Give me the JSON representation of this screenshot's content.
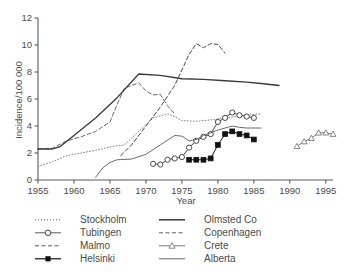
{
  "chart_data": {
    "type": "line",
    "title": "",
    "xlabel": "Year",
    "ylabel": "Incidence/100 000",
    "xlim": [
      1955,
      1996
    ],
    "ylim": [
      0,
      12
    ],
    "xticks": [
      1955,
      1960,
      1965,
      1970,
      1975,
      1980,
      1985,
      1990,
      1995
    ],
    "yticks": [
      0,
      2,
      4,
      6,
      8,
      10,
      12
    ],
    "grid": false,
    "legend_position": "below-plot",
    "axis_color": "#5a5a5a",
    "series": [
      {
        "name": "Stockholm",
        "style": "dotted",
        "marker": "none",
        "color": "#8a8a8a",
        "x": [
          1955,
          1957,
          1959,
          1961,
          1963,
          1965,
          1967,
          1969,
          1971,
          1973,
          1974,
          1975,
          1977,
          1979,
          1981,
          1983,
          1985,
          1986
        ],
        "y": [
          1.0,
          1.35,
          1.8,
          2.0,
          2.2,
          2.45,
          2.6,
          3.6,
          4.6,
          4.9,
          4.7,
          4.4,
          4.35,
          4.45,
          4.6,
          4.75,
          4.85,
          4.9
        ]
      },
      {
        "name": "Tubingen",
        "style": "solid",
        "marker": "open-circle",
        "color": "#4a4a4a",
        "x": [
          1971,
          1972,
          1973,
          1974,
          1975,
          1976,
          1977,
          1978,
          1979,
          1980,
          1981,
          1982,
          1983,
          1984,
          1985
        ],
        "y": [
          1.2,
          1.15,
          1.5,
          1.6,
          1.7,
          2.4,
          2.9,
          3.2,
          3.4,
          4.3,
          4.6,
          5.0,
          4.8,
          4.7,
          4.6
        ]
      },
      {
        "name": "Malmo",
        "style": "dashed",
        "marker": "none",
        "color": "#6a6a6a",
        "x": [
          1955,
          1957,
          1959,
          1961,
          1963,
          1965,
          1966,
          1967,
          1968,
          1969,
          1970,
          1971,
          1972,
          1973,
          1974
        ],
        "y": [
          2.3,
          2.35,
          2.9,
          3.2,
          3.6,
          4.3,
          5.6,
          6.8,
          7.0,
          7.2,
          6.6,
          6.3,
          6.35,
          5.5,
          4.9
        ]
      },
      {
        "name": "Helsinki",
        "style": "solid",
        "marker": "filled-square",
        "color": "#111111",
        "x": [
          1976,
          1977,
          1978,
          1979,
          1980,
          1981,
          1982,
          1983,
          1984,
          1985
        ],
        "y": [
          1.5,
          1.5,
          1.5,
          1.6,
          2.6,
          3.4,
          3.6,
          3.4,
          3.3,
          3.0
        ]
      },
      {
        "name": "Olmsted Co",
        "style": "solid",
        "marker": "none",
        "color": "#3a3a3a",
        "x": [
          1955,
          1957,
          1958,
          1960,
          1963,
          1966,
          1969,
          1972,
          1975,
          1978,
          1981,
          1984,
          1986,
          1988.5
        ],
        "y": [
          2.3,
          2.3,
          2.45,
          3.3,
          4.6,
          6.1,
          7.85,
          7.75,
          7.5,
          7.45,
          7.35,
          7.25,
          7.15,
          7.0
        ]
      },
      {
        "name": "Copenhagen",
        "style": "dashed",
        "marker": "none",
        "color": "#4a4a4a",
        "x": [
          1966.5,
          1968,
          1970,
          1972,
          1974,
          1976,
          1977,
          1978,
          1979,
          1980,
          1981
        ],
        "y": [
          1.8,
          2.6,
          4.0,
          5.4,
          7.0,
          9.3,
          10.1,
          9.8,
          10.1,
          10.05,
          9.4
        ]
      },
      {
        "name": "Crete",
        "style": "solid",
        "marker": "open-triangle",
        "color": "#7a7a7a",
        "x": [
          1991,
          1992,
          1993,
          1994,
          1995,
          1996
        ],
        "y": [
          2.5,
          2.85,
          3.1,
          3.5,
          3.5,
          3.4
        ]
      },
      {
        "name": "Alberta",
        "style": "solid",
        "marker": "none",
        "color": "#6a6a6a",
        "x": [
          1963,
          1964,
          1965,
          1966,
          1968,
          1970,
          1972,
          1974,
          1975,
          1976,
          1977,
          1978,
          1980,
          1982,
          1983,
          1984,
          1986
        ],
        "y": [
          0.2,
          0.9,
          1.3,
          1.5,
          1.55,
          1.9,
          2.6,
          3.3,
          3.25,
          2.9,
          3.0,
          3.3,
          3.7,
          4.0,
          3.9,
          3.85,
          3.85
        ]
      }
    ]
  },
  "axes": {
    "ylabel": "Incidence/100 000",
    "xlabel": "Year",
    "xtick_labels": [
      "1955",
      "1960",
      "1965",
      "1970",
      "1975",
      "1980",
      "1985",
      "1990",
      "1995"
    ],
    "ytick_labels": [
      "0",
      "2",
      "4",
      "6",
      "8",
      "10",
      "12"
    ]
  },
  "legend": {
    "column_left": [
      {
        "label": "Stockholm",
        "sample": "dotted-line"
      },
      {
        "label": "Tubingen",
        "sample": "line-open-circle"
      },
      {
        "label": "Malmo",
        "sample": "dashed-line"
      },
      {
        "label": "Helsinki",
        "sample": "line-filled-square"
      }
    ],
    "column_right": [
      {
        "label": "Olmsted Co",
        "sample": "solid-line-thick"
      },
      {
        "label": "Copenhagen",
        "sample": "dashed-line"
      },
      {
        "label": "Crete",
        "sample": "line-open-triangle"
      },
      {
        "label": "Alberta",
        "sample": "solid-line-thin"
      }
    ]
  }
}
